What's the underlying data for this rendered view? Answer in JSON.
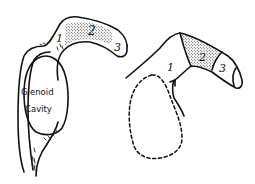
{
  "figure": {
    "left_view": {
      "labels": [
        "1",
        "2",
        "3"
      ],
      "cavity_label_line1": "Glenoid",
      "cavity_label_line2": "Cavity"
    },
    "right_view": {
      "labels": [
        "1",
        "2",
        "3"
      ]
    }
  },
  "colors": {
    "ink": "#111111",
    "background": "#ffffff"
  }
}
